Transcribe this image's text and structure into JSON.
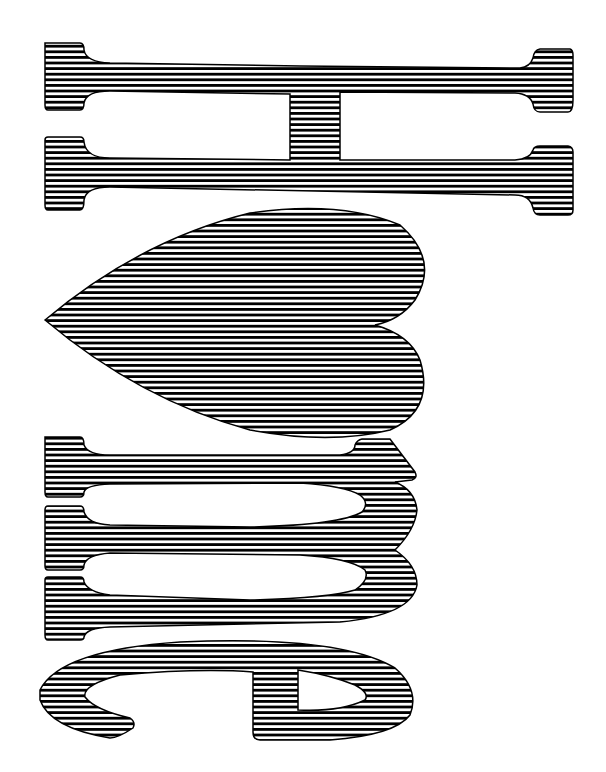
{
  "artwork": {
    "description": "Rotated striped lettering",
    "letters": [
      "H",
      "heart",
      "m",
      "e"
    ],
    "text": "H ♥ me",
    "stripe_color": "#000000",
    "background_color": "#ffffff"
  }
}
